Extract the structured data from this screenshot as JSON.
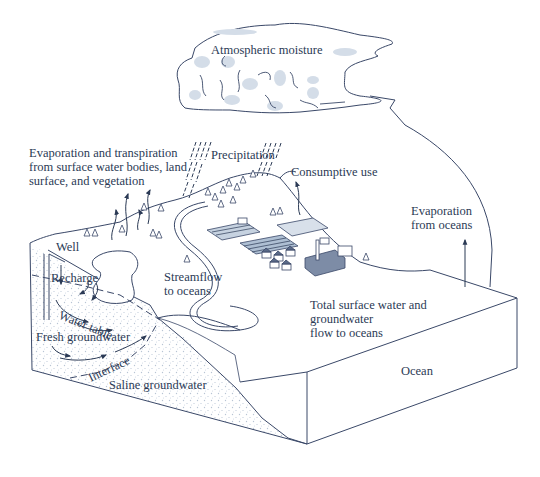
{
  "diagram": {
    "type": "hydrologic-cycle-block-diagram",
    "colors": {
      "ink": "#2b3a55",
      "line": "#3a4868",
      "cloud_shade": "#d4dde8",
      "sediment_dots": "#b8c4d4",
      "background": "#ffffff"
    },
    "labels": {
      "atmospheric_moisture": "Atmospheric moisture",
      "evapotranspiration": {
        "line1": "Evaporation and transpiration",
        "line2": "from surface water bodies, land",
        "line3": "surface, and vegetation"
      },
      "precipitation": "Precipitation",
      "consumptive_use": "Consumptive use",
      "evaporation_oceans": {
        "line1": "Evaporation",
        "line2": "from oceans"
      },
      "well": "Well",
      "recharge": "Recharge",
      "water_table": "Water table",
      "fresh_groundwater": "Fresh groundwater",
      "interface": "Interface",
      "saline_groundwater": "Saline groundwater",
      "streamflow": {
        "line1": "Streamflow",
        "line2": "to oceans"
      },
      "total_flow": {
        "line1": "Total surface water and",
        "line2": "groundwater",
        "line3": "flow to oceans"
      },
      "ocean": "Ocean"
    },
    "icons": [
      "cloud-icon",
      "rain-icon",
      "tree-icon",
      "well-icon",
      "building-icon",
      "field-icon",
      "arrow-icon"
    ]
  }
}
